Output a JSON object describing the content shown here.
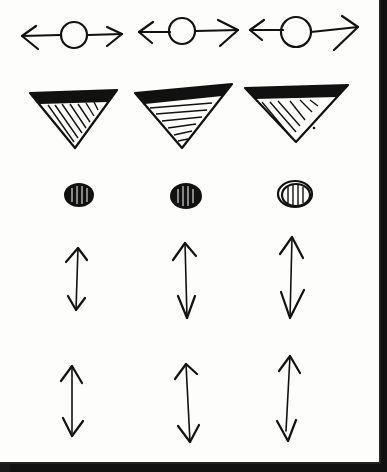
{
  "sketch": {
    "description": "Hand-drawn sketch grid of symbols on paper",
    "rows": [
      {
        "name": "horizontal-arrows-with-circle",
        "count": 3
      },
      {
        "name": "hatched-inverted-triangles",
        "count": 3
      },
      {
        "name": "hatched-dots",
        "count": 3
      },
      {
        "name": "vertical-double-arrows-upper",
        "count": 3
      },
      {
        "name": "vertical-double-arrows-lower",
        "count": 3
      }
    ],
    "colors": {
      "paper": "#fdfdfb",
      "ink": "#111111",
      "background": "#1a1a1a"
    }
  }
}
